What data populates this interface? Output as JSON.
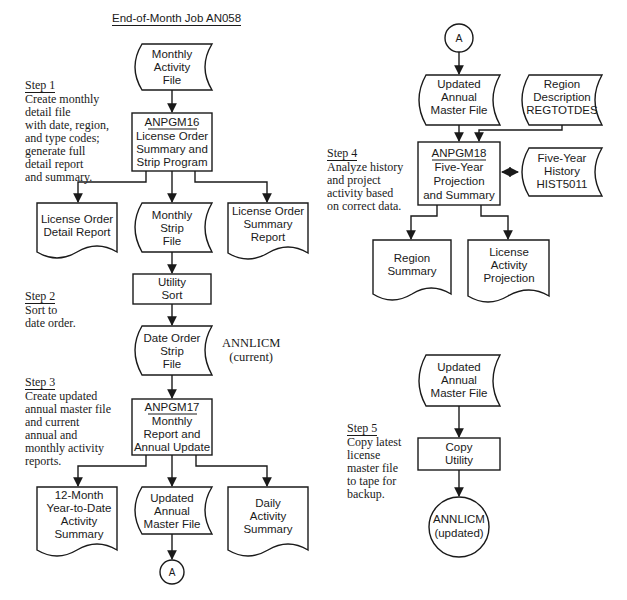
{
  "title": "End-of-Month Job AN058",
  "steps": [
    {
      "heading": "Step 1",
      "text": "Create monthly\ndetail file\nwith date, region,\nand type codes;\ngenerate full\ndetail report\nand summary."
    },
    {
      "heading": "Step 2",
      "text": "Sort to\ndate order."
    },
    {
      "heading": "Step 3",
      "text": "Create updated\nannual master file\nand current\nannual and\nmonthly activity\nreports."
    },
    {
      "heading": "Step 4",
      "text": "Analyze history\nand project\nactivity based\non correct data."
    },
    {
      "heading": "Step 5",
      "text": "Copy latest\nlicense\nmaster file\nto tape for\nbackup."
    }
  ],
  "annotation_current": {
    "line1": "ANNLICM",
    "line2": "(current)"
  },
  "nodes": {
    "monthly_activity_file": {
      "lines": [
        "Monthly",
        "Activity",
        "File"
      ],
      "type": "file"
    },
    "anpgm16": {
      "id": "ANPGM16",
      "lines": [
        "License Order",
        "Summary and",
        "Strip Program"
      ],
      "type": "process"
    },
    "license_order_detail_report": {
      "lines": [
        "License Order",
        "Detail Report"
      ],
      "type": "document"
    },
    "monthly_strip_file": {
      "lines": [
        "Monthly",
        "Strip",
        "File"
      ],
      "type": "file"
    },
    "license_order_summary_report": {
      "lines": [
        "License Order",
        "Summary",
        "Report"
      ],
      "type": "document"
    },
    "utility_sort": {
      "lines": [
        "Utility",
        "Sort"
      ],
      "type": "process"
    },
    "date_order_strip_file": {
      "lines": [
        "Date Order",
        "Strip",
        "File"
      ],
      "type": "file"
    },
    "anpgm17": {
      "id": "ANPGM17",
      "lines": [
        "Monthly",
        "Report and",
        "Annual Update"
      ],
      "type": "process"
    },
    "ytd_activity_summary": {
      "lines": [
        "12-Month",
        "Year-to-Date",
        "Activity",
        "Summary"
      ],
      "type": "document"
    },
    "updated_annual_master_file_1": {
      "lines": [
        "Updated",
        "Annual",
        "Master File"
      ],
      "type": "file"
    },
    "daily_activity_summary": {
      "lines": [
        "Daily",
        "Activity",
        "Summary"
      ],
      "type": "document"
    },
    "connector_a_out": {
      "label": "A",
      "type": "connector"
    },
    "connector_a_in": {
      "label": "A",
      "type": "connector"
    },
    "updated_annual_master_file_2": {
      "lines": [
        "Updated",
        "Annual",
        "Master File"
      ],
      "type": "file"
    },
    "region_description": {
      "lines": [
        "Region",
        "Description",
        "REGTOTDES"
      ],
      "type": "file"
    },
    "anpgm18": {
      "id": "ANPGM18",
      "lines": [
        "Five-Year",
        "Projection",
        "and Summary"
      ],
      "type": "process"
    },
    "five_year_history": {
      "lines": [
        "Five-Year",
        "History",
        "HIST5011"
      ],
      "type": "file"
    },
    "region_summary": {
      "lines": [
        "Region",
        "Summary"
      ],
      "type": "document"
    },
    "license_activity_projection": {
      "lines": [
        "License",
        "Activity",
        "Projection"
      ],
      "type": "document"
    },
    "updated_annual_master_file_3": {
      "lines": [
        "Updated",
        "Annual",
        "Master File"
      ],
      "type": "file"
    },
    "copy_utility": {
      "lines": [
        "Copy",
        "Utility"
      ],
      "type": "process"
    },
    "annlicm_updated": {
      "lines": [
        "ANNLICM",
        "(updated)"
      ],
      "type": "tape"
    }
  }
}
